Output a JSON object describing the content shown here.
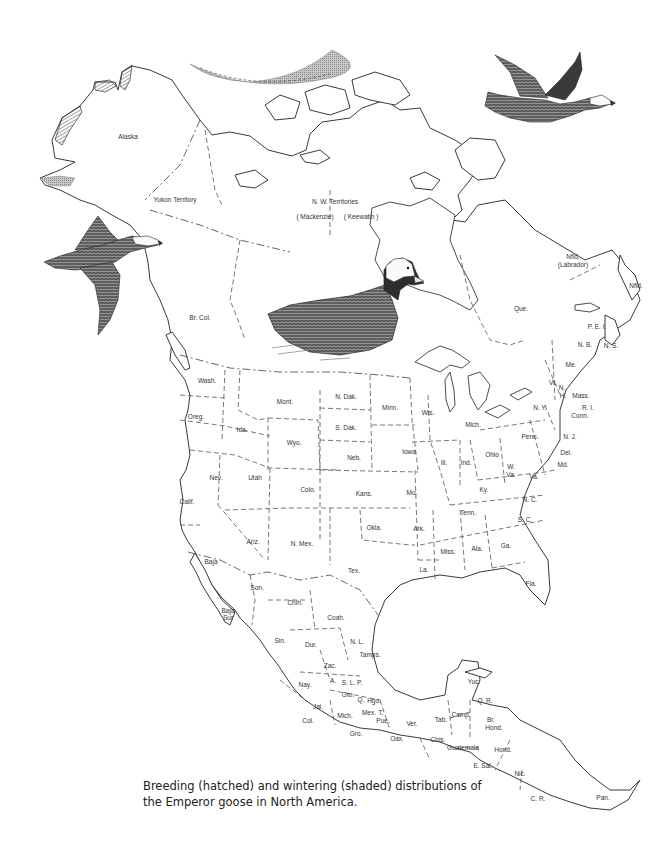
{
  "figure": {
    "caption": "Breeding (hatched) and wintering (shaded) distributions of the Emperor goose in North America.",
    "legend": {
      "breeding": {
        "pattern": "hatched",
        "meaning": "Breeding distribution"
      },
      "wintering": {
        "pattern": "shaded",
        "meaning": "Wintering distribution"
      }
    },
    "colors": {
      "ink": "#333333",
      "hatch": "#444444",
      "shade": "#9a9a9a",
      "background": "#ffffff"
    }
  },
  "illustrations": [
    {
      "name": "flying-goose-right",
      "description": "Emperor goose in flight, facing right (top right)"
    },
    {
      "name": "flying-goose-left",
      "description": "Emperor goose in flight, facing right (left side)"
    },
    {
      "name": "swimming-goose",
      "description": "Emperor goose swimming (center)"
    }
  ],
  "labels": {
    "alaska": "Alaska",
    "yukon": "Yukon Territory",
    "nwt": "N. W. Territories",
    "mackenzie": "( Mackenzie)",
    "keewatin": "( Keewatin )",
    "brcol": "Br. Col.",
    "nfld_lab": "Nfld.",
    "labrador": "(Labrador)",
    "nfld": "Nfld.",
    "que": "Que.",
    "pei": "P. E. I.",
    "nb": "N. B.",
    "ns": "N. S.",
    "me": "Me.",
    "vt": "Vt.",
    "nh1": "N.",
    "nh2": "H.",
    "mass": "Mass.",
    "ri": "R. I.",
    "conn": "Conn.",
    "ny": "N. Y.",
    "nj": "N. J.",
    "penn": "Penn.",
    "del": "Del.",
    "md": "Md.",
    "wash": "Wash.",
    "oreg": "Oreg.",
    "ida": "Ida.",
    "mont": "Mont.",
    "wyo": "Wyo.",
    "ndak": "N. Dak.",
    "sdak": "S. Dak.",
    "minn": "Minn.",
    "wis": "Wis.",
    "mich": "Mich.",
    "iowa": "Iowa",
    "neb": "Neb.",
    "ill": "Ill.",
    "ind": "Ind.",
    "ohio": "Ohio",
    "wva1": "W.",
    "wva2": "Va.",
    "va": "Va.",
    "ky": "Ky.",
    "nc": "N. C.",
    "sc": "S. C.",
    "tenn": "Tenn.",
    "nev": "Nev.",
    "utah": "Utah",
    "colo": "Colo.",
    "kans": "Kans.",
    "mo": "Mo.",
    "calif": "Calif.",
    "ariz": "Ariz.",
    "nmex": "N. Mex.",
    "okla": "Okla.",
    "ark": "Ark.",
    "tex": "Tex.",
    "la": "La.",
    "miss": "Miss.",
    "ala": "Ala.",
    "ga": "Ga.",
    "fla": "Fla.",
    "baja": "Baja",
    "bajasur": "Baja Sur",
    "son": "Son.",
    "chih": "Chih.",
    "coah": "Coah.",
    "nl": "N. L.",
    "tamps": "Tamps.",
    "sin": "Sin.",
    "dur": "Dur.",
    "zac": "Zac.",
    "slp": "S. L. P.",
    "nay": "Nay.",
    "ags": "A.",
    "gto": "Gto.",
    "q": "Q.",
    "hgo": "Hgo.",
    "jal": "Jal.",
    "mich_mx": "Mich.",
    "mex": "Mex.",
    "t": "T.",
    "pue": "Pue.",
    "col": "Col.",
    "gro": "Gro.",
    "oax": "Oax.",
    "ver": "Ver.",
    "tab": "Tab.",
    "camp": "Camp.",
    "yuc": "Yuc.",
    "qr": "Q. R.",
    "chis": "Chis.",
    "guatemala": "Guatemala",
    "brhond1": "Br.",
    "brhond2": "Hond.",
    "hond": "Hond.",
    "elsal": "E. Sal.",
    "nic": "Nic.",
    "cr": "C. R.",
    "pan": "Pan."
  }
}
